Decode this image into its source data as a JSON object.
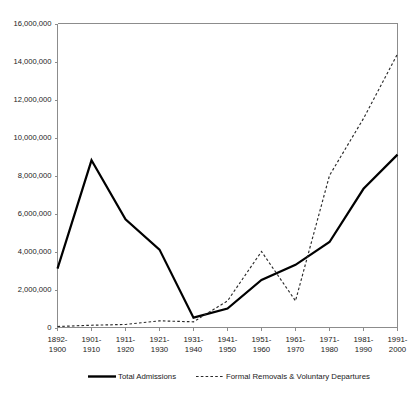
{
  "chart_data": {
    "type": "line",
    "title": "",
    "subtitle": "",
    "xlabel": "",
    "ylabel": "",
    "ylim": [
      0,
      16000000
    ],
    "xlim_categories": 11,
    "grid": false,
    "legend_position": "bottom",
    "categories": [
      "1892-\n1900",
      "1901-\n1910",
      "1911-\n1920",
      "1921-\n1930",
      "1931-\n1940",
      "1941-\n1950",
      "1951-\n1960",
      "1961-\n1970",
      "1971-\n1980",
      "1981-\n1990",
      "1991-\n2000"
    ],
    "category_lines": [
      [
        "1892-",
        "1900"
      ],
      [
        "1901-",
        "1910"
      ],
      [
        "1911-",
        "1920"
      ],
      [
        "1921-",
        "1930"
      ],
      [
        "1931-",
        "1940"
      ],
      [
        "1941-",
        "1950"
      ],
      [
        "1951-",
        "1960"
      ],
      [
        "1961-",
        "1970"
      ],
      [
        "1971-",
        "1980"
      ],
      [
        "1981-",
        "1990"
      ],
      [
        "1991-",
        "2000"
      ]
    ],
    "ytick_values": [
      0,
      2000000,
      4000000,
      6000000,
      8000000,
      10000000,
      12000000,
      14000000,
      16000000
    ],
    "ytick_labels": [
      "0",
      "2,000,000",
      "4,000,000",
      "6,000,000",
      "8,000,000",
      "10,000,000",
      "12,000,000",
      "14,000,000",
      "16,000,000"
    ],
    "series": [
      {
        "name": "Total Admissions",
        "style": "solid",
        "color": "#000000",
        "values": [
          3100000,
          8800000,
          5700000,
          4100000,
          520000,
          1000000,
          2500000,
          3300000,
          4500000,
          7300000,
          9100000
        ]
      },
      {
        "name": "Formal Removals & Voluntary Departures",
        "style": "dashed",
        "color": "#2b2b2b",
        "values": [
          50000,
          120000,
          160000,
          350000,
          300000,
          1400000,
          4000000,
          1400000,
          8000000,
          11000000,
          14400000
        ]
      }
    ]
  },
  "legend": {
    "items": [
      {
        "label": "Total Admissions",
        "style": "solid"
      },
      {
        "label": "Formal Removals & Voluntary Departures",
        "style": "dashed"
      }
    ]
  }
}
